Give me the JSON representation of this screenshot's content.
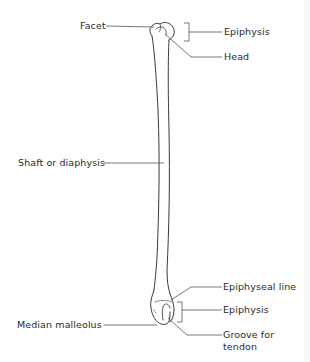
{
  "diagram": {
    "labels": {
      "facet": "Facet",
      "epiphysis_top": "Epiphysis",
      "head": "Head",
      "shaft": "Shaft or diaphysis",
      "epiphyseal_line": "Epiphyseal line",
      "epiphysis_bottom": "Epiphysis",
      "median_malleolus": "Median malleolus",
      "groove_line1": "Groove for",
      "groove_line2": "tendon"
    },
    "colors": {
      "background": "#ffffff",
      "line": "#3a3a3a",
      "text": "#2a2a2a"
    }
  }
}
